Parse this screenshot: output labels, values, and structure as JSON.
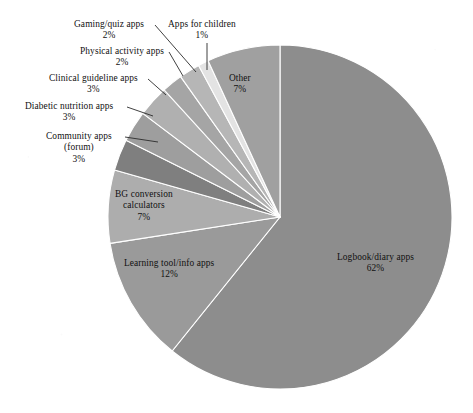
{
  "chart_data": {
    "type": "pie",
    "title": "",
    "subtitle": "",
    "xlabel": "",
    "ylabel": "",
    "legend_position": "none",
    "grid": false,
    "units": "percent",
    "start_angle_deg": 0,
    "direction": "clockwise",
    "total": 100,
    "categories": [
      "Logbook/diary apps",
      "Learning tool/info apps",
      "BG conversion calculators",
      "Community apps (forum)",
      "Diabetic nutrition apps",
      "Clinical guideline apps",
      "Physical activity apps",
      "Gaming/quiz apps",
      "Apps for children",
      "Other"
    ],
    "values": [
      62,
      12,
      7,
      3,
      3,
      3,
      2,
      2,
      1,
      7
    ],
    "slices": [
      {
        "id": "logbook-diary-apps",
        "label": "Logbook/diary apps",
        "label_line2": "",
        "percent_text": "62%",
        "value": 62,
        "color": "#8d8d8d",
        "label_x": 337,
        "label_y": 252,
        "align": "align-center",
        "leader": null
      },
      {
        "id": "learning-tool-info-apps",
        "label": "Learning tool/info apps",
        "label_line2": "",
        "percent_text": "12%",
        "value": 12,
        "color": "#9a9a9a",
        "label_x": 124,
        "label_y": 258,
        "align": "align-center",
        "leader": null
      },
      {
        "id": "bg-conversion-calculators",
        "label": "BG conversion",
        "label_line2": "calculators",
        "percent_text": "7%",
        "value": 7,
        "color": "#adadad",
        "label_x": 115,
        "label_y": 189,
        "align": "align-center",
        "leader": null
      },
      {
        "id": "community-apps-forum",
        "label": "Community apps",
        "label_line2": "(forum)",
        "percent_text": "3%",
        "value": 3,
        "color": "#7f7f7f",
        "label_x": 46,
        "label_y": 131,
        "align": "align-center",
        "leader": {
          "x1": 125,
          "y1": 137,
          "x2": 158,
          "y2": 142
        }
      },
      {
        "id": "diabetic-nutrition-apps",
        "label": "Diabetic nutrition apps",
        "label_line2": "",
        "percent_text": "3%",
        "value": 3,
        "color": "#9e9e9e",
        "label_x": 25,
        "label_y": 101,
        "align": "align-center",
        "leader": {
          "x1": 127,
          "y1": 107,
          "x2": 153,
          "y2": 116
        }
      },
      {
        "id": "clinical-guideline-apps",
        "label": "Clinical guideline apps",
        "label_line2": "",
        "percent_text": "3%",
        "value": 3,
        "color": "#b0b0b0",
        "label_x": 49,
        "label_y": 73,
        "align": "align-center",
        "leader": {
          "x1": 148,
          "y1": 79,
          "x2": 166,
          "y2": 95
        }
      },
      {
        "id": "physical-activity-apps",
        "label": "Physical activity apps",
        "label_line2": "",
        "percent_text": "2%",
        "value": 2,
        "color": "#a5a5a5",
        "label_x": 80,
        "label_y": 46,
        "align": "align-center",
        "leader": {
          "x1": 169,
          "y1": 52,
          "x2": 183,
          "y2": 76
        }
      },
      {
        "id": "gaming-quiz-apps",
        "label": "Gaming/quiz apps",
        "label_line2": "",
        "percent_text": "2%",
        "value": 2,
        "color": "#b6b6b6",
        "label_x": 74,
        "label_y": 19,
        "align": "align-center",
        "leader": {
          "x1": 155,
          "y1": 25,
          "x2": 196,
          "y2": 72
        }
      },
      {
        "id": "apps-for-children",
        "label": "Apps for children",
        "label_line2": "",
        "percent_text": "1%",
        "value": 1,
        "color": "#e3e3e3",
        "label_x": 168,
        "label_y": 19,
        "align": "align-center",
        "leader": {
          "x1": 207,
          "y1": 43,
          "x2": 207,
          "y2": 70
        }
      },
      {
        "id": "other",
        "label": "Other",
        "label_line2": "",
        "percent_text": "7%",
        "value": 7,
        "color": "#a0a0a0",
        "label_x": 229,
        "label_y": 73,
        "align": "align-center",
        "leader": null
      }
    ],
    "geometry": {
      "center_x": 280,
      "center_y": 217,
      "radius": 172
    }
  }
}
